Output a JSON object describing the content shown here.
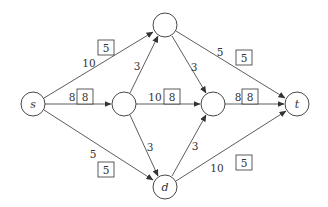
{
  "diagram": {
    "type": "flow-network",
    "nodes": [
      {
        "id": "s",
        "label": "s",
        "x": 33,
        "y": 104
      },
      {
        "id": "u",
        "label": "",
        "x": 124,
        "y": 104
      },
      {
        "id": "a",
        "label": "",
        "x": 165,
        "y": 25
      },
      {
        "id": "v",
        "label": "",
        "x": 213,
        "y": 104
      },
      {
        "id": "d",
        "label": "d",
        "x": 165,
        "y": 187
      },
      {
        "id": "t",
        "label": "t",
        "x": 297,
        "y": 104
      }
    ],
    "edges": [
      {
        "from": "s",
        "to": "a",
        "capacity": "10",
        "flow": "5"
      },
      {
        "from": "s",
        "to": "u",
        "capacity": "8",
        "flow": "8"
      },
      {
        "from": "s",
        "to": "d",
        "capacity": "5",
        "flow": "5"
      },
      {
        "from": "u",
        "to": "a",
        "capacity": "3",
        "flow": ""
      },
      {
        "from": "u",
        "to": "v",
        "capacity": "10",
        "flow": "8"
      },
      {
        "from": "u",
        "to": "d",
        "capacity": "3",
        "flow": ""
      },
      {
        "from": "a",
        "to": "v",
        "capacity": "3",
        "flow": ""
      },
      {
        "from": "a",
        "to": "t",
        "capacity": "5",
        "flow": "5"
      },
      {
        "from": "v",
        "to": "t",
        "capacity": "8",
        "flow": "8"
      },
      {
        "from": "d",
        "to": "v",
        "capacity": "3",
        "flow": ""
      },
      {
        "from": "d",
        "to": "t",
        "capacity": "10",
        "flow": "5"
      }
    ]
  },
  "labels": {
    "s": "s",
    "d": "d",
    "t": "t",
    "cap_s_a": "10",
    "flow_s_a": "5",
    "cap_s_u": "8",
    "flow_s_u": "8",
    "cap_s_d": "5",
    "flow_s_d": "5",
    "cap_u_a": "3",
    "cap_u_v": "10",
    "flow_u_v": "8",
    "cap_u_d": "3",
    "cap_a_v": "3",
    "cap_a_t": "5",
    "flow_a_t": "5",
    "cap_v_t": "8",
    "flow_v_t": "8",
    "cap_d_v": "3",
    "cap_d_t": "10",
    "flow_d_t": "5"
  }
}
